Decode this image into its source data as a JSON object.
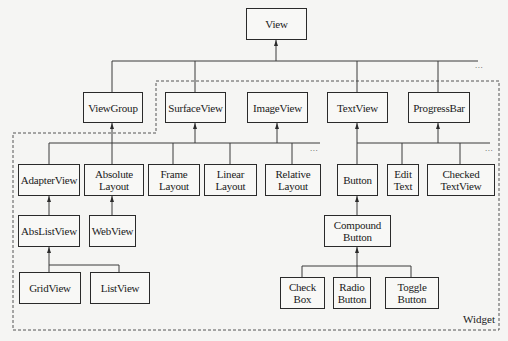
{
  "diagram": {
    "colors": {
      "line": "#3a3a3a",
      "box_border": "#2a2a2a",
      "background": "#f5f5f3",
      "dashed": "#555555"
    },
    "root": {
      "id": "view",
      "label": "View"
    },
    "nodes": {
      "view": "View",
      "viewgroup": "ViewGroup",
      "surfaceview": "SurfaceView",
      "imageview": "ImageView",
      "textview": "TextView",
      "progressbar": "ProgressBar",
      "adapterview": "AdapterView",
      "absolutelayout": "Absolute\nLayout",
      "framelayout": "Frame\nLayout",
      "linearlayout": "Linear\nLayout",
      "relativelayout": "Relative\nLayout",
      "button": "Button",
      "edittext": "Edit\nText",
      "checkedtextview": "Checked\nTextView",
      "abslistview": "AbsListView",
      "webview": "WebView",
      "compoundbutton": "Compound\nButton",
      "gridview": "GridView",
      "listview": "ListView",
      "checkbox": "Check\nBox",
      "radiobutton": "Radio\nButton",
      "togglebutton": "Toggle\nButton"
    },
    "edges": [
      [
        "viewgroup",
        "view"
      ],
      [
        "surfaceview",
        "view"
      ],
      [
        "imageview",
        "view"
      ],
      [
        "textview",
        "view"
      ],
      [
        "progressbar",
        "view"
      ],
      [
        "adapterview",
        "viewgroup"
      ],
      [
        "absolutelayout",
        "viewgroup"
      ],
      [
        "framelayout",
        "viewgroup"
      ],
      [
        "linearlayout",
        "viewgroup"
      ],
      [
        "relativelayout",
        "viewgroup"
      ],
      [
        "button",
        "textview"
      ],
      [
        "edittext",
        "textview"
      ],
      [
        "checkedtextview",
        "textview"
      ],
      [
        "abslistview",
        "adapterview"
      ],
      [
        "webview",
        "absolutelayout"
      ],
      [
        "gridview",
        "abslistview"
      ],
      [
        "listview",
        "abslistview"
      ],
      [
        "compoundbutton",
        "button"
      ],
      [
        "checkbox",
        "compoundbutton"
      ],
      [
        "radiobutton",
        "compoundbutton"
      ],
      [
        "togglebutton",
        "compoundbutton"
      ]
    ],
    "ellipsis": "...",
    "group_label": "Widget"
  }
}
